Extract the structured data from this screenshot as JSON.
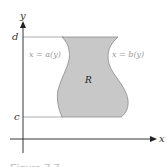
{
  "figure": {
    "axes": {
      "x_label": "x",
      "y_label": "y"
    },
    "ticks": {
      "top": "d",
      "bottom": "c"
    },
    "curves": {
      "left": "x = a(y)",
      "right": "x = b(y)"
    },
    "region_label": "R",
    "caption": "Figure 7.7"
  },
  "colors": {
    "region_fill": "#c8c8c8",
    "region_stroke": "#8a8a8a",
    "axis": "#222222",
    "guide": "#9a9a9a",
    "curve_label": "#9a9a9a"
  }
}
